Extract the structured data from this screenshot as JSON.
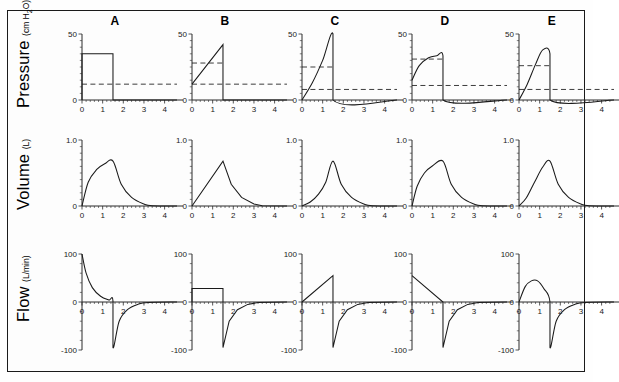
{
  "figure": {
    "column_headers": [
      "A",
      "B",
      "C",
      "D",
      "E"
    ],
    "row_labels": [
      {
        "name": "Pressure",
        "units": "(cm H2O)"
      },
      {
        "name": "Volume",
        "units": "(L)"
      },
      {
        "name": "Flow",
        "units": "(L/min)"
      }
    ],
    "frame_color": "#1a1a1a",
    "curve_color": "#1a1a1a"
  },
  "chart_data": [
    {
      "type": "line",
      "panel": "A",
      "row": "Pressure",
      "title": "A",
      "xlabel": "",
      "ylabel": "Pressure (cm H2O)",
      "xlim": [
        0,
        4.6
      ],
      "ylim": [
        0,
        50
      ],
      "xticks": [
        0,
        1,
        2,
        3,
        4
      ],
      "yticks": [
        0,
        50
      ],
      "ytick_labels": [
        "0",
        "50"
      ],
      "grid": false,
      "legend": "none",
      "annotations": [
        "square pressure waveform",
        "dashed PEEP/baseline line at 12"
      ],
      "series": [
        {
          "name": "pressure",
          "x": [
            0,
            0,
            1.5,
            1.5,
            4.6
          ],
          "values": [
            0,
            35,
            35,
            0,
            0
          ]
        },
        {
          "name": "baseline-dashed",
          "x": [
            0,
            4.6
          ],
          "values": [
            12,
            12
          ],
          "style": "dashed"
        }
      ]
    },
    {
      "type": "line",
      "panel": "B",
      "row": "Pressure",
      "title": "B",
      "xlim": [
        0,
        4.6
      ],
      "ylim": [
        0,
        50
      ],
      "xticks": [
        0,
        1,
        2,
        3,
        4
      ],
      "yticks": [
        0,
        50
      ],
      "ytick_labels": [
        "0",
        "50"
      ],
      "annotations": [
        "ascending ramp pressure",
        "two dashed reference lines at 28 and 12"
      ],
      "series": [
        {
          "name": "pressure",
          "x": [
            0,
            1.5,
            1.5,
            4.6
          ],
          "values": [
            12,
            42,
            0,
            0
          ]
        },
        {
          "name": "dashed-upper",
          "x": [
            0,
            1.5
          ],
          "values": [
            28,
            28
          ],
          "style": "dashed"
        },
        {
          "name": "dashed-lower",
          "x": [
            0,
            4.6
          ],
          "values": [
            12,
            12
          ],
          "style": "dashed"
        }
      ]
    },
    {
      "type": "line",
      "panel": "C",
      "row": "Pressure",
      "title": "C",
      "xlim": [
        0,
        4.6
      ],
      "ylim": [
        0,
        50
      ],
      "xticks": [
        0,
        1,
        2,
        3,
        4
      ],
      "yticks": [
        0,
        50
      ],
      "ytick_labels": [
        "0",
        "50"
      ],
      "annotations": [
        "accelerating convex rise to 50",
        "dashed lines at 25 and 8"
      ],
      "series": [
        {
          "name": "pressure",
          "x": [
            0,
            0.5,
            1.0,
            1.5,
            1.5,
            4.6
          ],
          "values": [
            0,
            13,
            30,
            50,
            0,
            0
          ]
        },
        {
          "name": "dashed-upper",
          "x": [
            0,
            1.5
          ],
          "values": [
            25,
            25
          ],
          "style": "dashed"
        },
        {
          "name": "dashed-lower",
          "x": [
            0,
            4.6
          ],
          "values": [
            8,
            8
          ],
          "style": "dashed"
        }
      ]
    },
    {
      "type": "line",
      "panel": "D",
      "row": "Pressure",
      "title": "D",
      "xlim": [
        0,
        4.6
      ],
      "ylim": [
        0,
        50
      ],
      "xticks": [
        0,
        1,
        2,
        3,
        4
      ],
      "yticks": [
        0,
        50
      ],
      "ytick_labels": [
        "0",
        "50"
      ],
      "annotations": [
        "decelerating rise to plateau 33",
        "dashed lines at 31 and 11"
      ],
      "series": [
        {
          "name": "pressure",
          "x": [
            0,
            0.35,
            0.8,
            1.2,
            1.5,
            1.5,
            4.6
          ],
          "values": [
            15,
            26,
            32,
            33.5,
            33.5,
            0,
            0
          ]
        },
        {
          "name": "dashed-upper",
          "x": [
            0,
            1.5
          ],
          "values": [
            31,
            31
          ],
          "style": "dashed"
        },
        {
          "name": "dashed-lower",
          "x": [
            0,
            4.6
          ],
          "values": [
            11,
            11
          ],
          "style": "dashed"
        }
      ]
    },
    {
      "type": "line",
      "panel": "E",
      "row": "Pressure",
      "title": "E",
      "xlim": [
        0,
        4.6
      ],
      "ylim": [
        0,
        50
      ],
      "xticks": [
        0,
        1,
        2,
        3,
        4
      ],
      "yticks": [
        0,
        50
      ],
      "ytick_labels": [
        "0",
        "50"
      ],
      "annotations": [
        "sinusoidal rise peaking at 38",
        "dashed lines at 26 and 8"
      ],
      "series": [
        {
          "name": "pressure",
          "x": [
            0,
            0.4,
            0.8,
            1.15,
            1.5,
            1.5,
            4.6
          ],
          "values": [
            0,
            12,
            27,
            38,
            35,
            0,
            0
          ]
        },
        {
          "name": "dashed-upper",
          "x": [
            0,
            1.5
          ],
          "values": [
            26,
            26
          ],
          "style": "dashed"
        },
        {
          "name": "dashed-lower",
          "x": [
            0,
            4.6
          ],
          "values": [
            8,
            8
          ],
          "style": "dashed"
        }
      ]
    },
    {
      "type": "line",
      "panel": "A",
      "row": "Volume",
      "xlim": [
        0,
        4.6
      ],
      "ylim": [
        0,
        1.0
      ],
      "xticks": [
        0,
        1,
        2,
        3,
        4
      ],
      "yticks": [
        0,
        1.0
      ],
      "ytick_labels": [
        "0",
        "1.0"
      ],
      "annotations": [
        "exponential inflation to 0.68 L then passive exhalation"
      ],
      "series": [
        {
          "name": "volume",
          "x": [
            0,
            0.3,
            0.7,
            1.1,
            1.5,
            1.9,
            2.4,
            3.0,
            3.4,
            4.6
          ],
          "values": [
            0,
            0.36,
            0.55,
            0.64,
            0.68,
            0.33,
            0.13,
            0.03,
            0.005,
            0
          ]
        }
      ]
    },
    {
      "type": "line",
      "panel": "B",
      "row": "Volume",
      "xlim": [
        0,
        4.6
      ],
      "ylim": [
        0,
        1.0
      ],
      "xticks": [
        0,
        1,
        2,
        3,
        4
      ],
      "yticks": [
        0,
        1.0
      ],
      "ytick_labels": [
        "0",
        "1.0"
      ],
      "annotations": [
        "linear inflation to 0.68 L then passive exhalation"
      ],
      "series": [
        {
          "name": "volume",
          "x": [
            0,
            1.5,
            1.9,
            2.4,
            3.0,
            3.4,
            4.6
          ],
          "values": [
            0,
            0.68,
            0.33,
            0.13,
            0.03,
            0.005,
            0
          ]
        }
      ]
    },
    {
      "type": "line",
      "panel": "C",
      "row": "Volume",
      "xlim": [
        0,
        4.6
      ],
      "ylim": [
        0,
        1.0
      ],
      "xticks": [
        0,
        1,
        2,
        3,
        4
      ],
      "yticks": [
        0,
        1.0
      ],
      "ytick_labels": [
        "0",
        "1.0"
      ],
      "annotations": [
        "accelerating inflation to 0.68 L then passive exhalation"
      ],
      "series": [
        {
          "name": "volume",
          "x": [
            0,
            0.4,
            0.8,
            1.15,
            1.5,
            1.9,
            2.4,
            3.0,
            3.4,
            4.6
          ],
          "values": [
            0,
            0.06,
            0.18,
            0.36,
            0.68,
            0.33,
            0.13,
            0.03,
            0.005,
            0
          ]
        }
      ]
    },
    {
      "type": "line",
      "panel": "D",
      "row": "Volume",
      "xlim": [
        0,
        4.6
      ],
      "ylim": [
        0,
        1.0
      ],
      "xticks": [
        0,
        1,
        2,
        3,
        4
      ],
      "yticks": [
        0,
        1.0
      ],
      "ytick_labels": [
        "0",
        "1.0"
      ],
      "annotations": [
        "decelerating inflation to 0.68 L then passive exhalation"
      ],
      "series": [
        {
          "name": "volume",
          "x": [
            0,
            0.25,
            0.6,
            1.0,
            1.5,
            1.9,
            2.4,
            3.0,
            3.4,
            4.6
          ],
          "values": [
            0,
            0.3,
            0.5,
            0.61,
            0.68,
            0.33,
            0.13,
            0.03,
            0.005,
            0
          ]
        }
      ]
    },
    {
      "type": "line",
      "panel": "E",
      "row": "Volume",
      "xlim": [
        0,
        4.6
      ],
      "ylim": [
        0,
        1.0
      ],
      "xticks": [
        0,
        1,
        2,
        3,
        4
      ],
      "yticks": [
        0,
        1.0
      ],
      "ytick_labels": [
        "0",
        "1.0"
      ],
      "annotations": [
        "sinusoidal inflation to 0.68 L then passive exhalation"
      ],
      "series": [
        {
          "name": "volume",
          "x": [
            0,
            0.35,
            0.75,
            1.15,
            1.5,
            1.9,
            2.4,
            3.0,
            3.4,
            4.6
          ],
          "values": [
            0,
            0.12,
            0.36,
            0.59,
            0.68,
            0.33,
            0.13,
            0.03,
            0.005,
            0
          ]
        }
      ]
    },
    {
      "type": "line",
      "panel": "A",
      "row": "Flow",
      "xlim": [
        0,
        4.6
      ],
      "ylim": [
        -100,
        100
      ],
      "xticks": [
        0,
        1,
        2,
        3,
        4
      ],
      "yticks": [
        -100,
        0,
        100
      ],
      "ytick_labels": [
        "-100",
        "0",
        "100"
      ],
      "annotations": [
        "decelerating (exponential decay) inspiratory flow from 100 L/min, expiratory trough -95"
      ],
      "series": [
        {
          "name": "flow",
          "x": [
            0,
            0.2,
            0.5,
            0.9,
            1.3,
            1.5,
            1.5,
            1.8,
            2.2,
            2.7,
            3.2,
            4.6
          ],
          "values": [
            100,
            60,
            30,
            12,
            4,
            2,
            -95,
            -40,
            -16,
            -5,
            -1,
            0
          ]
        }
      ]
    },
    {
      "type": "line",
      "panel": "B",
      "row": "Flow",
      "xlim": [
        0,
        4.6
      ],
      "ylim": [
        -100,
        100
      ],
      "xticks": [
        0,
        1,
        2,
        3,
        4
      ],
      "yticks": [
        -100,
        0,
        100
      ],
      "ytick_labels": [
        "-100",
        "0",
        "100"
      ],
      "annotations": [
        "constant (square) inspiratory flow 28 L/min, expiratory trough -95"
      ],
      "series": [
        {
          "name": "flow",
          "x": [
            0,
            0,
            1.5,
            1.5,
            1.8,
            2.2,
            2.7,
            3.2,
            4.6
          ],
          "values": [
            0,
            28,
            28,
            -95,
            -40,
            -16,
            -5,
            -1,
            0
          ]
        }
      ]
    },
    {
      "type": "line",
      "panel": "C",
      "row": "Flow",
      "xlim": [
        0,
        4.6
      ],
      "ylim": [
        -100,
        100
      ],
      "xticks": [
        0,
        1,
        2,
        3,
        4
      ],
      "yticks": [
        -100,
        0,
        100
      ],
      "ytick_labels": [
        "-100",
        "0",
        "100"
      ],
      "annotations": [
        "ascending ramp inspiratory flow 0 to 55 L/min, expiratory trough -95"
      ],
      "series": [
        {
          "name": "flow",
          "x": [
            0,
            1.5,
            1.5,
            1.8,
            2.2,
            2.7,
            3.2,
            4.6
          ],
          "values": [
            0,
            55,
            -95,
            -40,
            -16,
            -5,
            -1,
            0
          ]
        }
      ]
    },
    {
      "type": "line",
      "panel": "D",
      "row": "Flow",
      "xlim": [
        0,
        4.6
      ],
      "ylim": [
        -100,
        100
      ],
      "xticks": [
        0,
        1,
        2,
        3,
        4
      ],
      "yticks": [
        -100,
        0,
        100
      ],
      "ytick_labels": [
        "-100",
        "0",
        "100"
      ],
      "annotations": [
        "descending ramp inspiratory flow 55 to 0 L/min, expiratory trough -95"
      ],
      "series": [
        {
          "name": "flow",
          "x": [
            0,
            1.5,
            1.5,
            1.8,
            2.2,
            2.7,
            3.2,
            4.6
          ],
          "values": [
            55,
            0,
            -95,
            -40,
            -16,
            -5,
            -1,
            0
          ]
        }
      ]
    },
    {
      "type": "line",
      "panel": "E",
      "row": "Flow",
      "xlim": [
        0,
        4.6
      ],
      "ylim": [
        -100,
        100
      ],
      "xticks": [
        0,
        1,
        2,
        3,
        4
      ],
      "yticks": [
        -100,
        0,
        100
      ],
      "ytick_labels": [
        "-100",
        "0",
        "100"
      ],
      "annotations": [
        "sinusoidal inspiratory flow peaking 45 L/min at 0.75 s, expiratory trough -95"
      ],
      "series": [
        {
          "name": "flow",
          "x": [
            0,
            0.3,
            0.6,
            0.9,
            1.2,
            1.5,
            1.5,
            1.8,
            2.2,
            2.7,
            3.2,
            4.6
          ],
          "values": [
            0,
            32,
            44,
            44,
            28,
            0,
            -95,
            -40,
            -16,
            -5,
            -1,
            0
          ]
        }
      ]
    }
  ]
}
